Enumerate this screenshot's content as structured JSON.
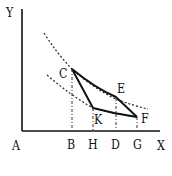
{
  "diagram": {
    "axes": {
      "y_label": "Y",
      "x_label": "X",
      "origin_label": "A"
    },
    "points": {
      "C": "C",
      "E": "E",
      "F": "F",
      "K": "K"
    },
    "x_ticks": [
      "B",
      "H",
      "D",
      "G"
    ],
    "colors": {
      "line": "#111111",
      "background": "#ffffff"
    }
  }
}
